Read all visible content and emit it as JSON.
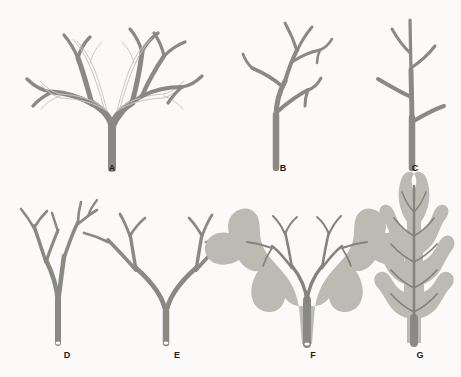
{
  "figure": {
    "background_color": "#fbfaf8",
    "stroke_color": "#8a8a85",
    "dark_stroke_color": "#77776f",
    "pale_outline_color": "#c9c7c0",
    "blade_color": "#b9b8b0",
    "vein_color": "#86857d",
    "cut_base_color": "#ffffff",
    "label_color": "#1c1c1c",
    "columns_top": 3,
    "columns_bottom": 4,
    "specimen_count": 7
  },
  "specimens": [
    {
      "id": "A",
      "label": "A",
      "row": 1,
      "column": 1,
      "branching_type": "dichotomous",
      "description": "Repeatedly dichotomous thallus with stout basal stipe and paler secondary branch outlines overlaid",
      "has_pale_overlay_branches": true,
      "has_blade": false,
      "has_cut_base": false,
      "label_x": 112,
      "label_y": 168
    },
    {
      "id": "B",
      "label": "B",
      "row": 1,
      "column": 2,
      "branching_type": "alternate",
      "description": "Sympodial zig-zag main axis with alternately arranged lateral branches",
      "has_pale_overlay_branches": false,
      "has_blade": false,
      "has_cut_base": false,
      "label_x": 283,
      "label_y": 168
    },
    {
      "id": "C",
      "label": "C",
      "row": 1,
      "column": 3,
      "branching_type": "monopodial",
      "description": "Dominant straight central axis bearing short alternate upward-curving laterals",
      "has_pale_overlay_branches": false,
      "has_blade": false,
      "has_cut_base": false,
      "label_x": 415,
      "label_y": 168
    },
    {
      "id": "D",
      "label": "D",
      "row": 2,
      "column": 1,
      "branching_type": "dichotomous-narrow",
      "description": "Narrow-angled dichotomous thallus, branches nearly parallel, cut holdfast base",
      "has_pale_overlay_branches": false,
      "has_blade": false,
      "has_cut_base": true,
      "label_x": 67,
      "label_y": 355
    },
    {
      "id": "E",
      "label": "E",
      "row": 2,
      "column": 2,
      "branching_type": "dichotomous-wide",
      "description": "Wide-angled dichotomous thallus forming a symmetric V, cut holdfast base",
      "has_pale_overlay_branches": false,
      "has_blade": false,
      "has_cut_base": true,
      "label_x": 177,
      "label_y": 355
    },
    {
      "id": "F",
      "label": "F",
      "row": 2,
      "column": 3,
      "branching_type": "webbed-dichotomous",
      "description": "Fan-shaped webbed blade with darker dichotomously branching internal veins",
      "has_pale_overlay_branches": false,
      "has_blade": true,
      "has_cut_base": true,
      "label_x": 313,
      "label_y": 355
    },
    {
      "id": "G",
      "label": "G",
      "row": 2,
      "column": 4,
      "branching_type": "pinnate",
      "description": "Pinnate feather-like frond with central midrib and opposite-alternate lateral lobes",
      "has_pale_overlay_branches": false,
      "has_blade": true,
      "has_cut_base": false,
      "label_x": 420,
      "label_y": 355
    }
  ]
}
